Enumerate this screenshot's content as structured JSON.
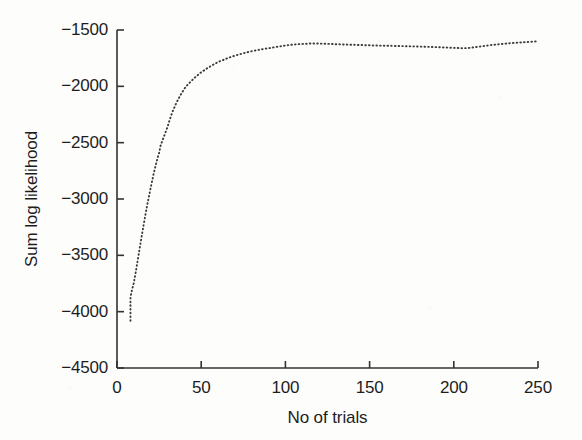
{
  "chart_data": {
    "type": "line",
    "title": "",
    "xlabel": "No of trials",
    "ylabel": "Sum log likelihood",
    "xlim": [
      0,
      250
    ],
    "ylim": [
      -4500,
      -1500
    ],
    "xticks": [
      0,
      50,
      100,
      150,
      200,
      250
    ],
    "yticks": [
      -4500,
      -4000,
      -3500,
      -3000,
      -2500,
      -2000,
      -1500
    ],
    "xtick_labels": [
      "0",
      "50",
      "100",
      "150",
      "200",
      "250"
    ],
    "ytick_labels": [
      "-4500",
      "-4000",
      "-3500",
      "-3000",
      "-2500",
      "-2000",
      "-1500"
    ],
    "grid": false,
    "legend": null,
    "line_style": "dotted",
    "marker": "dot",
    "line_color": "#3a3a3a",
    "background_color": "#fdfdfc",
    "axis_color": "#333333",
    "series": [
      {
        "name": "Sum log likelihood",
        "x": [
          8,
          8,
          8,
          9,
          10,
          11,
          12,
          13,
          14,
          15,
          16,
          17,
          18,
          19,
          20,
          21,
          22,
          23,
          24,
          25,
          26,
          27,
          28,
          29,
          30,
          31,
          32,
          33,
          34,
          35,
          36,
          38,
          40,
          42,
          44,
          46,
          48,
          50,
          52,
          54,
          56,
          58,
          60,
          62,
          64,
          66,
          68,
          70,
          73,
          76,
          79,
          82,
          85,
          88,
          91,
          94,
          97,
          100,
          103,
          106,
          109,
          112,
          115,
          118,
          121,
          124,
          127,
          130,
          134,
          138,
          142,
          146,
          150,
          154,
          158,
          162,
          166,
          170,
          174,
          178,
          182,
          186,
          190,
          194,
          198,
          202,
          206,
          210,
          214,
          218,
          222,
          226,
          230,
          234,
          238,
          242,
          246,
          250
        ],
        "y": [
          -4080,
          -3960,
          -3870,
          -3800,
          -3745,
          -3660,
          -3570,
          -3480,
          -3390,
          -3300,
          -3215,
          -3130,
          -3050,
          -2975,
          -2900,
          -2830,
          -2760,
          -2700,
          -2640,
          -2590,
          -2520,
          -2480,
          -2440,
          -2400,
          -2360,
          -2310,
          -2265,
          -2225,
          -2190,
          -2155,
          -2125,
          -2070,
          -2020,
          -1985,
          -1955,
          -1925,
          -1900,
          -1875,
          -1855,
          -1835,
          -1818,
          -1800,
          -1785,
          -1772,
          -1760,
          -1748,
          -1738,
          -1728,
          -1715,
          -1702,
          -1692,
          -1682,
          -1674,
          -1666,
          -1660,
          -1652,
          -1645,
          -1638,
          -1632,
          -1628,
          -1624,
          -1622,
          -1620,
          -1620,
          -1621,
          -1622,
          -1624,
          -1626,
          -1628,
          -1630,
          -1632,
          -1634,
          -1636,
          -1638,
          -1639,
          -1640,
          -1642,
          -1643,
          -1645,
          -1646,
          -1648,
          -1650,
          -1652,
          -1655,
          -1657,
          -1660,
          -1662,
          -1658,
          -1650,
          -1642,
          -1634,
          -1628,
          -1622,
          -1616,
          -1612,
          -1608,
          -1604,
          -1600
        ]
      }
    ]
  },
  "axis": {
    "y_title": "Sum log likelihood",
    "x_title": "No of trials"
  }
}
